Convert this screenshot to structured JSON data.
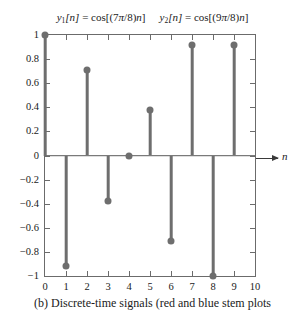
{
  "chart_data": {
    "type": "scatter",
    "plot_style": "stem",
    "equations": [
      {
        "lhs_base": "y",
        "lhs_sub": "1",
        "lhs_index": "[n]",
        "eq": "=",
        "rhs": "cos[(7π/8)n]"
      },
      {
        "lhs_base": "y",
        "lhs_sub": "2",
        "lhs_index": "[n]",
        "eq": "=",
        "rhs": "cos[(9π/8)n]"
      }
    ],
    "xlabel": "n",
    "ylabel": "",
    "xlim": [
      0,
      10
    ],
    "ylim": [
      -1,
      1
    ],
    "grid": false,
    "legend": "none",
    "x": [
      0,
      1,
      2,
      3,
      4,
      5,
      6,
      7,
      8,
      9
    ],
    "values": [
      1,
      -0.92,
      0.71,
      -0.38,
      0,
      0.38,
      -0.71,
      0.92,
      -1,
      0.92
    ],
    "xticks": [
      "0",
      "1",
      "2",
      "3",
      "4",
      "5",
      "6",
      "7",
      "8",
      "9",
      "10"
    ],
    "xtick_values": [
      0,
      1,
      2,
      3,
      4,
      5,
      6,
      7,
      8,
      9,
      10
    ],
    "yticks": [
      "1",
      "0.8",
      "0.6",
      "0.4",
      "0.2",
      "0",
      "−0.2",
      "−0.4",
      "−0.6",
      "−0.8",
      "−1"
    ],
    "ytick_values": [
      1,
      0.8,
      0.6,
      0.4,
      0.2,
      0,
      -0.2,
      -0.4,
      -0.6,
      -0.8,
      -1
    ],
    "series_color": "#6e6e6e",
    "axis_color": "#6b6b6b"
  },
  "caption": {
    "text": "(b)  Discrete-time signals (red and blue stem plots"
  }
}
